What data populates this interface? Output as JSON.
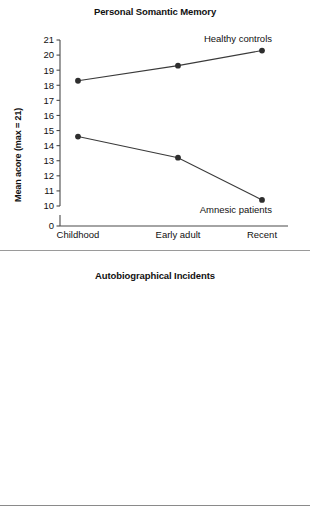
{
  "page": {
    "background": "#ffffff",
    "line_color": "#3a3a3a",
    "point_color": "#2e2e2e",
    "axis_color": "#4a4a4a",
    "rule_top_label": "divider-rule"
  },
  "chart_data": [
    {
      "type": "line",
      "id": "personal-somantic-memory",
      "title": "Personal Somantic Memory",
      "xlabel": "",
      "ylabel": "Mean acore (max = 21)",
      "categories": [
        "Childhood",
        "Early adult",
        "Recent"
      ],
      "yticks": [
        21,
        20,
        19,
        18,
        17,
        16,
        15,
        14,
        13,
        12,
        11,
        10,
        0
      ],
      "ylim": [
        10,
        21
      ],
      "axis_break": true,
      "zero_tick": 0,
      "grid": false,
      "legend_position": "inline-annotation",
      "series": [
        {
          "name": "Healthy controls",
          "values": [
            18.3,
            19.3,
            20.3
          ],
          "label_anchor": "above-right"
        },
        {
          "name": "Amnesic patients",
          "values": [
            14.6,
            13.2,
            10.4
          ],
          "label_anchor": "below-right"
        }
      ]
    },
    {
      "type": "line",
      "id": "autobiographical-incidents",
      "title": "Autobiographical Incidents",
      "xlabel": "",
      "ylabel": "Mean acore (max = 9)",
      "categories": [
        "Childhood",
        "Early adult",
        "Recent"
      ],
      "yticks": [
        9,
        8,
        7,
        6,
        5,
        4,
        0
      ],
      "ylim": [
        4,
        9
      ],
      "axis_break": true,
      "zero_tick": 0,
      "grid": false,
      "legend_position": "inline-annotation",
      "series": [
        {
          "name": "Healthy controls",
          "values": [
            7.75,
            7.72,
            8.3
          ],
          "label_anchor": "above-right"
        },
        {
          "name": "Amnesic patients",
          "values": [
            4.7,
            4.55,
            3.68
          ],
          "label_anchor": "below-right"
        }
      ]
    }
  ]
}
